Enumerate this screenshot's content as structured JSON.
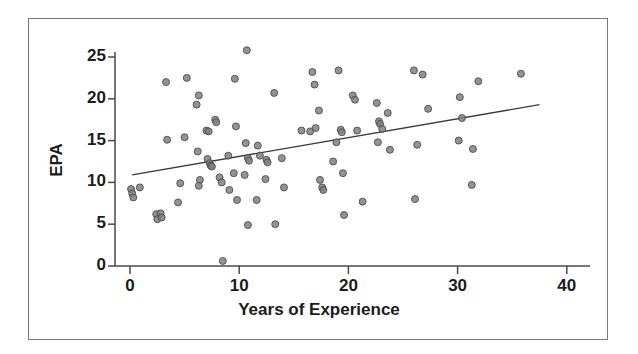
{
  "chart_data": {
    "type": "scatter",
    "title": "",
    "xlabel": "Years of Experience",
    "ylabel": "EPA",
    "xlim": [
      -2,
      42
    ],
    "ylim": [
      0,
      26.5
    ],
    "xticks": [
      0,
      10,
      20,
      30,
      40
    ],
    "yticks": [
      0,
      5,
      10,
      15,
      20,
      25
    ],
    "xtick_labels": [
      "0",
      "10",
      "20",
      "30",
      "40"
    ],
    "ytick_labels": [
      "0",
      "5",
      "10",
      "15",
      "20",
      "25"
    ],
    "grid": false,
    "legend": null,
    "marker_color": "#808080",
    "marker_edge_color": "#4d4d4d",
    "marker_size": 7,
    "trendline": {
      "name": "linear fit",
      "color": "#3a3a3a",
      "x_start": 0.2,
      "y_start": 10.9,
      "x_end": 37.5,
      "y_end": 19.3
    },
    "points": [
      {
        "x": 0.1,
        "y": 9.2
      },
      {
        "x": 0.2,
        "y": 8.7
      },
      {
        "x": 0.3,
        "y": 8.2
      },
      {
        "x": 0.9,
        "y": 9.4
      },
      {
        "x": 2.4,
        "y": 6.2
      },
      {
        "x": 2.5,
        "y": 5.6
      },
      {
        "x": 2.8,
        "y": 6.3
      },
      {
        "x": 2.9,
        "y": 5.8
      },
      {
        "x": 3.3,
        "y": 22.0
      },
      {
        "x": 3.4,
        "y": 15.1
      },
      {
        "x": 5.2,
        "y": 22.5
      },
      {
        "x": 5.0,
        "y": 15.4
      },
      {
        "x": 4.6,
        "y": 9.9
      },
      {
        "x": 4.4,
        "y": 7.6
      },
      {
        "x": 6.3,
        "y": 20.4
      },
      {
        "x": 6.1,
        "y": 19.3
      },
      {
        "x": 6.2,
        "y": 13.7
      },
      {
        "x": 6.4,
        "y": 10.3
      },
      {
        "x": 6.3,
        "y": 9.6
      },
      {
        "x": 7.0,
        "y": 16.2
      },
      {
        "x": 7.2,
        "y": 16.1
      },
      {
        "x": 7.1,
        "y": 12.8
      },
      {
        "x": 7.3,
        "y": 12.3
      },
      {
        "x": 7.4,
        "y": 12.0
      },
      {
        "x": 7.5,
        "y": 11.9
      },
      {
        "x": 7.8,
        "y": 17.5
      },
      {
        "x": 7.9,
        "y": 17.2
      },
      {
        "x": 8.2,
        "y": 10.6
      },
      {
        "x": 8.4,
        "y": 10.0
      },
      {
        "x": 8.5,
        "y": 0.6
      },
      {
        "x": 9.0,
        "y": 13.2
      },
      {
        "x": 9.1,
        "y": 9.1
      },
      {
        "x": 9.6,
        "y": 22.4
      },
      {
        "x": 9.7,
        "y": 16.7
      },
      {
        "x": 9.5,
        "y": 11.1
      },
      {
        "x": 9.8,
        "y": 7.9
      },
      {
        "x": 10.7,
        "y": 25.8
      },
      {
        "x": 10.6,
        "y": 14.7
      },
      {
        "x": 10.8,
        "y": 12.9
      },
      {
        "x": 10.9,
        "y": 12.6
      },
      {
        "x": 10.5,
        "y": 10.9
      },
      {
        "x": 10.8,
        "y": 4.9
      },
      {
        "x": 11.7,
        "y": 14.4
      },
      {
        "x": 11.9,
        "y": 13.2
      },
      {
        "x": 11.6,
        "y": 7.9
      },
      {
        "x": 12.5,
        "y": 12.7
      },
      {
        "x": 12.6,
        "y": 12.4
      },
      {
        "x": 12.4,
        "y": 10.4
      },
      {
        "x": 13.2,
        "y": 20.7
      },
      {
        "x": 13.3,
        "y": 5.0
      },
      {
        "x": 13.9,
        "y": 12.9
      },
      {
        "x": 14.1,
        "y": 9.4
      },
      {
        "x": 15.7,
        "y": 16.2
      },
      {
        "x": 16.5,
        "y": 16.1
      },
      {
        "x": 16.7,
        "y": 23.2
      },
      {
        "x": 16.9,
        "y": 21.7
      },
      {
        "x": 17.0,
        "y": 16.5
      },
      {
        "x": 17.3,
        "y": 18.6
      },
      {
        "x": 17.4,
        "y": 10.3
      },
      {
        "x": 17.6,
        "y": 9.4
      },
      {
        "x": 17.7,
        "y": 9.1
      },
      {
        "x": 18.6,
        "y": 12.5
      },
      {
        "x": 18.9,
        "y": 14.8
      },
      {
        "x": 19.1,
        "y": 23.4
      },
      {
        "x": 19.3,
        "y": 16.3
      },
      {
        "x": 19.4,
        "y": 16.0
      },
      {
        "x": 19.5,
        "y": 11.1
      },
      {
        "x": 19.6,
        "y": 6.1
      },
      {
        "x": 20.4,
        "y": 20.4
      },
      {
        "x": 20.6,
        "y": 19.9
      },
      {
        "x": 20.8,
        "y": 16.2
      },
      {
        "x": 21.3,
        "y": 7.7
      },
      {
        "x": 22.6,
        "y": 19.5
      },
      {
        "x": 22.8,
        "y": 17.3
      },
      {
        "x": 22.9,
        "y": 17.0
      },
      {
        "x": 23.1,
        "y": 16.4
      },
      {
        "x": 22.7,
        "y": 14.8
      },
      {
        "x": 23.6,
        "y": 18.3
      },
      {
        "x": 23.8,
        "y": 13.9
      },
      {
        "x": 26.0,
        "y": 23.4
      },
      {
        "x": 26.3,
        "y": 14.5
      },
      {
        "x": 26.1,
        "y": 8.0
      },
      {
        "x": 26.8,
        "y": 22.9
      },
      {
        "x": 27.3,
        "y": 18.8
      },
      {
        "x": 30.2,
        "y": 20.2
      },
      {
        "x": 30.4,
        "y": 17.7
      },
      {
        "x": 30.1,
        "y": 15.0
      },
      {
        "x": 31.4,
        "y": 14.0
      },
      {
        "x": 31.3,
        "y": 9.7
      },
      {
        "x": 31.9,
        "y": 22.1
      },
      {
        "x": 35.8,
        "y": 23.0
      }
    ]
  },
  "axes": {
    "xlabel_text": "Years of Experience",
    "ylabel_text": "EPA"
  }
}
